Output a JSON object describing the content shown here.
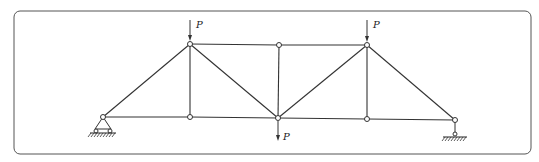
{
  "diagram": {
    "type": "truss",
    "colors": {
      "line": "#333333",
      "frame": "#555555",
      "background": "#ffffff"
    },
    "frame": {
      "x": 14,
      "y": 11,
      "width": 517,
      "height": 143,
      "radius": 6
    },
    "nodes": [
      {
        "id": "A",
        "x": 103,
        "y": 117
      },
      {
        "id": "B",
        "x": 190,
        "y": 44
      },
      {
        "id": "C",
        "x": 279,
        "y": 45
      },
      {
        "id": "D",
        "x": 367,
        "y": 45
      },
      {
        "id": "E",
        "x": 190,
        "y": 117
      },
      {
        "id": "F",
        "x": 278,
        "y": 118
      },
      {
        "id": "G",
        "x": 367,
        "y": 119
      },
      {
        "id": "H",
        "x": 455,
        "y": 120
      }
    ],
    "members": [
      [
        "A",
        "B"
      ],
      [
        "A",
        "E"
      ],
      [
        "E",
        "F"
      ],
      [
        "F",
        "G"
      ],
      [
        "G",
        "H"
      ],
      [
        "B",
        "C"
      ],
      [
        "C",
        "D"
      ],
      [
        "B",
        "E"
      ],
      [
        "B",
        "F"
      ],
      [
        "C",
        "F"
      ],
      [
        "D",
        "F"
      ],
      [
        "D",
        "G"
      ],
      [
        "D",
        "H"
      ]
    ],
    "supports": [
      {
        "node": "A",
        "type": "pin"
      },
      {
        "node": "H",
        "type": "roller"
      }
    ],
    "loads": [
      {
        "node": "B",
        "direction": "down",
        "label": "P",
        "position": "above"
      },
      {
        "node": "D",
        "direction": "down",
        "label": "P",
        "position": "above"
      },
      {
        "node": "F",
        "direction": "down",
        "label": "P",
        "position": "below"
      }
    ]
  }
}
